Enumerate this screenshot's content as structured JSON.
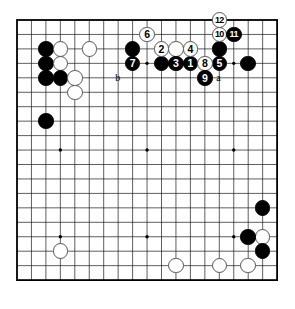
{
  "diagram": {
    "kind": "go-board-diagram",
    "board_size": 19,
    "geometry": {
      "left": 17,
      "top": 20,
      "spacing": 14.45,
      "stone_diameter": 15.5,
      "star_points": [
        [
          3,
          3
        ],
        [
          3,
          9
        ],
        [
          3,
          15
        ],
        [
          9,
          3
        ],
        [
          9,
          9
        ],
        [
          9,
          15
        ],
        [
          15,
          3
        ],
        [
          15,
          9
        ],
        [
          15,
          15
        ]
      ]
    },
    "colors": {
      "black": "#000000",
      "white": "#ffffff",
      "line": "#1a1a1a",
      "border": "#000000",
      "background": "#ffffff",
      "stone_outline": "#555555"
    },
    "plain_stones": [
      {
        "color": "black",
        "col": 2,
        "row": 2
      },
      {
        "color": "white",
        "col": 3,
        "row": 2
      },
      {
        "color": "white",
        "col": 5,
        "row": 2
      },
      {
        "color": "black",
        "col": 8,
        "row": 2
      },
      {
        "color": "black",
        "col": 2,
        "row": 3
      },
      {
        "color": "white",
        "col": 3,
        "row": 3
      },
      {
        "color": "black",
        "col": 2,
        "row": 4
      },
      {
        "color": "black",
        "col": 3,
        "row": 4
      },
      {
        "color": "white",
        "col": 4,
        "row": 4
      },
      {
        "color": "white",
        "col": 4,
        "row": 5
      },
      {
        "color": "black",
        "col": 2,
        "row": 7
      },
      {
        "color": "white",
        "col": 11,
        "row": 2
      },
      {
        "color": "black",
        "col": 14,
        "row": 2
      },
      {
        "color": "black",
        "col": 10,
        "row": 3
      },
      {
        "color": "black",
        "col": 16,
        "row": 3
      },
      {
        "color": "white",
        "col": 17,
        "row": 15
      },
      {
        "color": "black",
        "col": 17,
        "row": 13
      },
      {
        "color": "black",
        "col": 16,
        "row": 15
      },
      {
        "color": "black",
        "col": 17,
        "row": 16
      },
      {
        "color": "white",
        "col": 16,
        "row": 17
      },
      {
        "color": "white",
        "col": 3,
        "row": 16
      },
      {
        "color": "white",
        "col": 11,
        "row": 17
      },
      {
        "color": "white",
        "col": 14,
        "row": 17
      }
    ],
    "move_stones": [
      {
        "label": "1",
        "color": "black",
        "col": 12,
        "row": 3
      },
      {
        "label": "2",
        "color": "white",
        "col": 10,
        "row": 2
      },
      {
        "label": "3",
        "color": "black",
        "col": 11,
        "row": 3
      },
      {
        "label": "4",
        "color": "white",
        "col": 12,
        "row": 2
      },
      {
        "label": "5",
        "color": "black",
        "col": 14,
        "row": 3
      },
      {
        "label": "6",
        "color": "white",
        "col": 9,
        "row": 1
      },
      {
        "label": "7",
        "color": "black",
        "col": 8,
        "row": 3
      },
      {
        "label": "8",
        "color": "white",
        "col": 13,
        "row": 3
      },
      {
        "label": "9",
        "color": "black",
        "col": 13,
        "row": 4
      },
      {
        "label": "10",
        "color": "white",
        "col": 14,
        "row": 1
      },
      {
        "label": "11",
        "color": "black",
        "col": 15,
        "row": 1
      },
      {
        "label": "12",
        "color": "white",
        "col": 14,
        "row": 0
      }
    ],
    "letter_marks": [
      {
        "label": "b",
        "col": 7,
        "row": 4
      },
      {
        "label": "a",
        "col": 14,
        "row": 4
      }
    ]
  }
}
